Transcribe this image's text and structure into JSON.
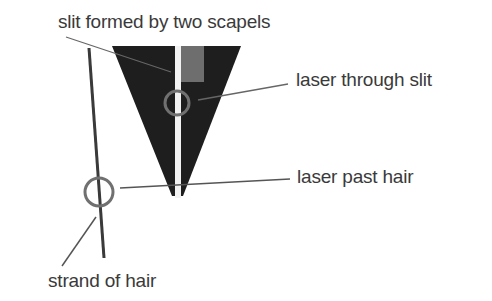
{
  "labels": {
    "slit": "slit formed by two scapels",
    "laser_through_slit": "laser through slit",
    "laser_past_hair": "laser past hair",
    "strand_of_hair": "strand of hair"
  },
  "colors": {
    "background": "#ffffff",
    "blade": "#1e1e1e",
    "blade_highlight": "#6e6e6e",
    "slit": "#f2f2f2",
    "leader_line": "#555555",
    "circle": "#707070",
    "hair": "#3a3a3a",
    "text": "#3a3a3a"
  }
}
